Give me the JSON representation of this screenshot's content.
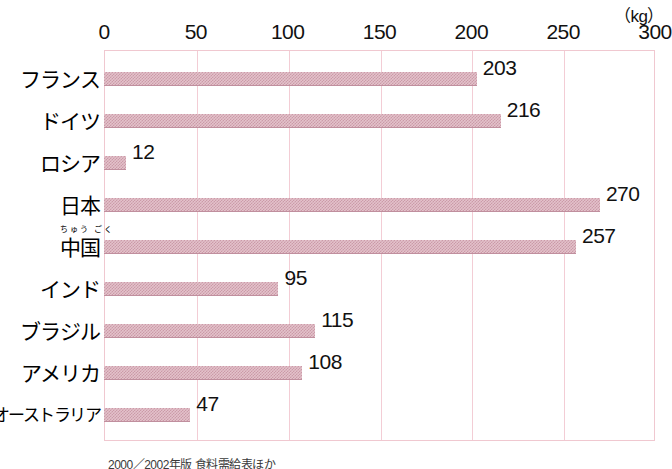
{
  "chart_data": {
    "type": "bar",
    "orientation": "horizontal",
    "title": "",
    "xlabel": "",
    "ylabel": "",
    "unit_label": "（kg）",
    "xlim": [
      0,
      300
    ],
    "xticks": [
      0,
      50,
      100,
      150,
      200,
      250,
      300
    ],
    "grid": true,
    "legend": null,
    "categories": [
      "フランス",
      "ドイツ",
      "ロシア",
      "日本",
      "中国",
      "インド",
      "ブラジル",
      "アメリカ",
      "オーストラリア"
    ],
    "values": [
      203,
      216,
      12,
      270,
      257,
      95,
      115,
      108,
      47
    ],
    "bar_color": "#e3c2ca",
    "frame_color": "#f0c8d0"
  },
  "axis": {
    "unit": "（kg）",
    "ticks": [
      {
        "label": "0",
        "value": 0
      },
      {
        "label": "50",
        "value": 50
      },
      {
        "label": "100",
        "value": 100
      },
      {
        "label": "150",
        "value": 150
      },
      {
        "label": "200",
        "value": 200
      },
      {
        "label": "250",
        "value": 250
      },
      {
        "label": "300",
        "value": 300
      }
    ]
  },
  "rows": [
    {
      "label": "フランス",
      "ruby": "",
      "value": 203,
      "value_label": "203",
      "small": false
    },
    {
      "label": "ドイツ",
      "ruby": "",
      "value": 216,
      "value_label": "216",
      "small": false
    },
    {
      "label": "ロシア",
      "ruby": "",
      "value": 12,
      "value_label": "12",
      "small": false
    },
    {
      "label": "日本",
      "ruby": "",
      "value": 270,
      "value_label": "270",
      "small": false
    },
    {
      "label": "中国",
      "ruby": "ちゅう ごく",
      "value": 257,
      "value_label": "257",
      "small": false
    },
    {
      "label": "インド",
      "ruby": "",
      "value": 95,
      "value_label": "95",
      "small": false
    },
    {
      "label": "ブラジル",
      "ruby": "",
      "value": 115,
      "value_label": "115",
      "small": false
    },
    {
      "label": "アメリカ",
      "ruby": "",
      "value": 108,
      "value_label": "108",
      "small": false
    },
    {
      "label": "オーストラリア",
      "ruby": "",
      "value": 47,
      "value_label": "47",
      "small": true
    }
  ],
  "source": {
    "text": "2000／2002年版 食料需給表ほか"
  }
}
